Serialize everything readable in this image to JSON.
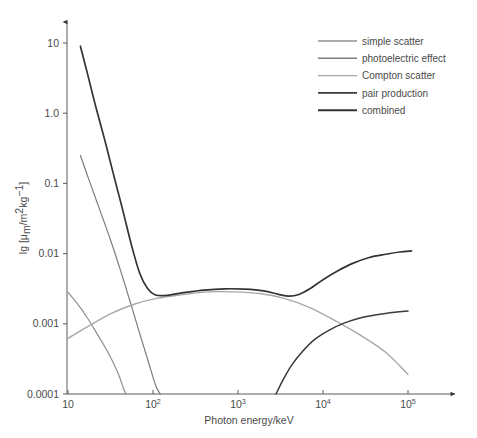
{
  "chart_data": {
    "type": "line",
    "title": "",
    "xlabel": "Photon energy/keV",
    "ylabel": "lg [μₘ/m²kg⁻¹]",
    "xscale": "log",
    "yscale": "log",
    "xlim": [
      10,
      150000
    ],
    "ylim": [
      0.0001,
      30
    ],
    "grid": false,
    "legend_position": "top-right",
    "xticks": [
      {
        "value": 10,
        "label": "10",
        "base": "10",
        "exp": ""
      },
      {
        "value": 100,
        "label": "10²",
        "base": "10",
        "exp": "2"
      },
      {
        "value": 1000,
        "label": "10³",
        "base": "10",
        "exp": "3"
      },
      {
        "value": 10000,
        "label": "10⁴",
        "base": "10",
        "exp": "4"
      },
      {
        "value": 100000,
        "label": "10⁵",
        "base": "10",
        "exp": "5"
      }
    ],
    "yticks": [
      {
        "value": 10,
        "label": "10"
      },
      {
        "value": 1.0,
        "label": "1.0"
      },
      {
        "value": 0.1,
        "label": "0.1"
      },
      {
        "value": 0.01,
        "label": "0.01"
      },
      {
        "value": 0.001,
        "label": "0.001"
      },
      {
        "value": 0.0001,
        "label": "0.0001"
      }
    ],
    "series": [
      {
        "name": "simple scatter",
        "color": "#8f8f8f",
        "width": 1.2,
        "points": [
          [
            10,
            0.0028
          ],
          [
            13,
            0.0019
          ],
          [
            17,
            0.0012
          ],
          [
            22,
            0.00072
          ],
          [
            28,
            0.00044
          ],
          [
            34,
            0.00028
          ],
          [
            40,
            0.00018
          ],
          [
            45,
            0.00012
          ],
          [
            48,
            0.0001
          ]
        ]
      },
      {
        "name": "photoelectric effect",
        "color": "#7d7d7d",
        "width": 1.2,
        "points": [
          [
            14,
            0.25
          ],
          [
            18,
            0.105
          ],
          [
            24,
            0.04
          ],
          [
            32,
            0.015
          ],
          [
            42,
            0.0055
          ],
          [
            55,
            0.0019
          ],
          [
            70,
            0.00072
          ],
          [
            88,
            0.00029
          ],
          [
            108,
            0.00013
          ],
          [
            122,
            0.0001
          ]
        ]
      },
      {
        "name": "Compton scatter",
        "color": "#a8a8a8",
        "width": 1.4,
        "points": [
          [
            10,
            0.00062
          ],
          [
            18,
            0.00095
          ],
          [
            32,
            0.0014
          ],
          [
            60,
            0.0019
          ],
          [
            110,
            0.0023
          ],
          [
            220,
            0.0026
          ],
          [
            450,
            0.00285
          ],
          [
            900,
            0.00285
          ],
          [
            1800,
            0.0027
          ],
          [
            3500,
            0.0023
          ],
          [
            7000,
            0.0017
          ],
          [
            14000,
            0.0011
          ],
          [
            28000,
            0.00068
          ],
          [
            55000,
            0.00039
          ],
          [
            100000,
            0.00019
          ]
        ]
      },
      {
        "name": "pair production",
        "color": "#3a3a3a",
        "width": 1.5,
        "points": [
          [
            2800,
            0.0001
          ],
          [
            3400,
            0.00016
          ],
          [
            4300,
            0.00026
          ],
          [
            5800,
            0.00041
          ],
          [
            8000,
            0.0006
          ],
          [
            12000,
            0.00082
          ],
          [
            18000,
            0.00103
          ],
          [
            28000,
            0.00122
          ],
          [
            45000,
            0.00136
          ],
          [
            70000,
            0.00146
          ],
          [
            100000,
            0.00152
          ]
        ]
      },
      {
        "name": "combined",
        "color": "#333333",
        "width": 1.7,
        "points": [
          [
            14,
            9.0
          ],
          [
            17,
            3.6
          ],
          [
            21,
            1.3
          ],
          [
            27,
            0.42
          ],
          [
            34,
            0.14
          ],
          [
            44,
            0.042
          ],
          [
            56,
            0.013
          ],
          [
            70,
            0.0052
          ],
          [
            86,
            0.0032
          ],
          [
            105,
            0.0026
          ],
          [
            140,
            0.00253
          ],
          [
            220,
            0.00275
          ],
          [
            400,
            0.00302
          ],
          [
            700,
            0.00315
          ],
          [
            1200,
            0.00312
          ],
          [
            2000,
            0.00295
          ],
          [
            3000,
            0.00262
          ],
          [
            4000,
            0.00248
          ],
          [
            5200,
            0.00262
          ],
          [
            7000,
            0.00315
          ],
          [
            10000,
            0.00425
          ],
          [
            15000,
            0.0057
          ],
          [
            22000,
            0.0072
          ],
          [
            35000,
            0.0088
          ],
          [
            55000,
            0.0098
          ],
          [
            80000,
            0.01055
          ],
          [
            110000,
            0.0109
          ]
        ]
      }
    ]
  },
  "legend": {
    "entries": [
      {
        "label": "simple scatter",
        "color": "#8f8f8f"
      },
      {
        "label": "photoelectric effect",
        "color": "#7d7d7d"
      },
      {
        "label": "Compton scatter",
        "color": "#a8a8a8"
      },
      {
        "label": "pair production",
        "color": "#3a3a3a"
      },
      {
        "label": "combined",
        "color": "#333333"
      }
    ]
  },
  "caption": {
    "text": ""
  }
}
